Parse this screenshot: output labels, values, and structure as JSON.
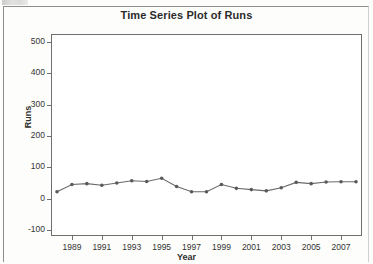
{
  "chart_data": {
    "type": "line",
    "title": "Time Series Plot of Runs",
    "xlabel": "Year",
    "ylabel": "Runs",
    "grid": false,
    "legend": null,
    "marker": "filled-circle",
    "line_color": "#6a6a6a",
    "marker_color": "#5a5a5a",
    "ylim": [
      -100,
      500
    ],
    "yticks": [
      -100,
      0,
      100,
      200,
      300,
      400,
      500
    ],
    "ytick_labels": [
      "-100",
      "0",
      "100",
      "200",
      "300",
      "400",
      "500"
    ],
    "xlim": [
      1988,
      2008
    ],
    "xticks": [
      1989,
      1991,
      1993,
      1995,
      1997,
      1999,
      2001,
      2003,
      2005,
      2007
    ],
    "xtick_labels": [
      "1989",
      "1991",
      "1993",
      "1995",
      "1997",
      "1999",
      "2001",
      "2003",
      "2005",
      "2007"
    ],
    "x": [
      1988,
      1989,
      1990,
      1991,
      1992,
      1993,
      1994,
      1995,
      1996,
      1997,
      1998,
      1999,
      2000,
      2001,
      2002,
      2003,
      2004,
      2005,
      2006,
      2007,
      2008
    ],
    "values": [
      22,
      45,
      48,
      43,
      50,
      57,
      55,
      65,
      39,
      22,
      22,
      45,
      33,
      29,
      25,
      35,
      52,
      48,
      53,
      54,
      54
    ],
    "series": [
      {
        "name": "Runs",
        "values": [
          22,
          45,
          48,
          43,
          50,
          57,
          55,
          65,
          39,
          22,
          22,
          45,
          33,
          29,
          25,
          35,
          52,
          48,
          53,
          54,
          54
        ]
      }
    ]
  },
  "page": {
    "background": "#fdfdfb",
    "frame_color": "#6f6f6f"
  }
}
